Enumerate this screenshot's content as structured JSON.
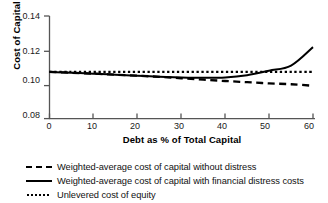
{
  "chart_data": {
    "type": "line",
    "title": "",
    "xlabel": "Debt as % of Total Capital",
    "ylabel": "Cost of Capital",
    "xlim": [
      0,
      60
    ],
    "ylim": [
      0.08,
      0.14
    ],
    "xticks": [
      "0",
      "10",
      "20",
      "30",
      "40",
      "50",
      "60"
    ],
    "yticks": [
      "0.08",
      "0.10",
      "0.12",
      "0.14"
    ],
    "grid": false,
    "legend_position": "below",
    "x": [
      0,
      5,
      10,
      15,
      20,
      25,
      30,
      35,
      40,
      45,
      50,
      55,
      60
    ],
    "series": [
      {
        "name": "Weighted-average cost of capital without distress",
        "style": "dashed",
        "color": "#000000",
        "values": [
          0.1073,
          0.1068,
          0.1063,
          0.1057,
          0.1051,
          0.1044,
          0.1036,
          0.1028,
          0.102,
          0.1013,
          0.1006,
          0.1001,
          0.0992
        ]
      },
      {
        "name": "Weighted-average cost of capital with financial distress costs",
        "style": "solid",
        "color": "#000000",
        "values": [
          0.1073,
          0.1068,
          0.1063,
          0.1057,
          0.1051,
          0.1045,
          0.1041,
          0.1039,
          0.1041,
          0.1054,
          0.108,
          0.111,
          0.1218
        ]
      },
      {
        "name": "Unlevered cost of equity",
        "style": "dotted",
        "color": "#000000",
        "values": [
          0.1073,
          0.1073,
          0.1073,
          0.1073,
          0.1073,
          0.1073,
          0.1073,
          0.1073,
          0.1073,
          0.1073,
          0.1073,
          0.1073,
          0.1073
        ]
      }
    ],
    "annotations": []
  },
  "legend": {
    "entries": [
      {
        "label": "Weighted-average cost of capital without distress",
        "marker": "dashed-line-marker"
      },
      {
        "label": "Weighted-average cost of capital with financial distress costs",
        "marker": "solid-line-marker"
      },
      {
        "label": "Unlevered cost of equity",
        "marker": "dotted-line-marker"
      }
    ]
  },
  "axes": {
    "y_label": "Cost of Capital",
    "x_label": "Debt as % of Total Capital",
    "y_tick_labels": [
      "0.14",
      "0.12",
      "0.10",
      "0.08"
    ],
    "x_tick_labels": [
      "0",
      "10",
      "20",
      "30",
      "40",
      "50",
      "60"
    ]
  },
  "colors": {
    "line": "#000000",
    "axis": "#4d4d4d",
    "background": "#ffffff"
  }
}
